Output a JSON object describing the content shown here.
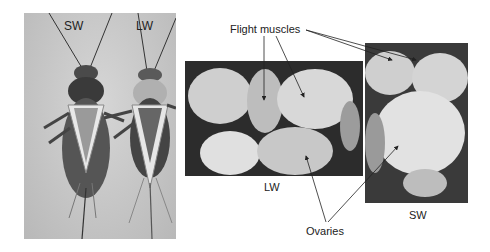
{
  "figure": {
    "panel_a": {
      "labels": [
        "SW",
        "LW"
      ],
      "description": "Dorsal view of short-winged (SW) and long-winged (LW) crickets"
    },
    "panel_b": {
      "label": "LW",
      "description": "Dissected long-winged cricket showing flight muscles and ovaries"
    },
    "panel_c": {
      "label": "SW",
      "description": "Dissected short-winged cricket showing flight muscles and ovaries"
    },
    "annotations": {
      "flight_muscles": "Flight muscles",
      "ovaries": "Ovaries"
    },
    "colors": {
      "background": "#ffffff",
      "text": "#222222",
      "arrow": "#222222"
    }
  }
}
